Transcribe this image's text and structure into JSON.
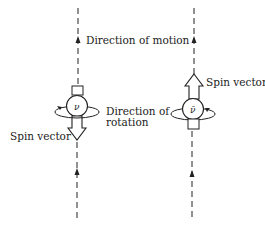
{
  "diagram": {
    "type": "neutrino vs antineutrino helicity",
    "labels": {
      "direction_of_motion": "Direction of motion",
      "direction_of_rotation_line1": "Direction of",
      "direction_of_rotation_line2": "rotation",
      "spin_vector_left": "Spin vector",
      "spin_vector_right": "Spin vector"
    },
    "particles": [
      {
        "symbol": "ν",
        "name": "neutrino",
        "spin_direction": "opposite to motion (down)"
      },
      {
        "symbol": "ν̄",
        "name": "antineutrino",
        "spin_direction": "along motion (up)"
      }
    ],
    "colors": {
      "ink": "#222222",
      "background": "#ffffff"
    }
  }
}
